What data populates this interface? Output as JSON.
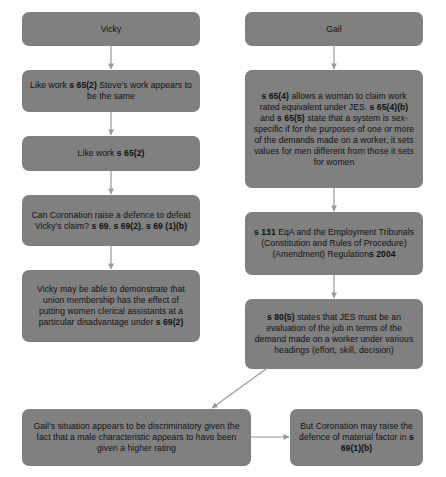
{
  "diagram": {
    "box_color": "#808080",
    "text_color": "#111111",
    "edge_color": "#9a9a9a",
    "background": "#ffffff",
    "columns": [
      {
        "name": "left-column",
        "heading": "Vicky"
      },
      {
        "name": "right-column",
        "heading": "Gail"
      }
    ],
    "nodes": [
      {
        "id": "vicky-header",
        "text": "Vicky"
      },
      {
        "id": "vicky-like-work-steve",
        "text": "Like work s 65(2)   Steve's work appears to be the same"
      },
      {
        "id": "vicky-like-work",
        "text": "Like work s 65(2)"
      },
      {
        "id": "vicky-defence",
        "text": "Can Coronation raise a defence to defeat Vicky's claim? s 69, s 69(2), s 69 (1)(b)"
      },
      {
        "id": "vicky-union-membership",
        "text": "Vicky may be able to demonstrate that union membership has the effect of putting women clerical assistants at a particular disadvantage under s 69(2)"
      },
      {
        "id": "gail-header",
        "text": "Gail"
      },
      {
        "id": "gail-s65",
        "text": "s 65(4) allows a woman to claim work rated equivalent under JES. s 65(4)(b) and s 65(5) state that a system is sex-specific if for the purposes of one or more of the demands made on a worker, it sets values for men different from those it sets for women"
      },
      {
        "id": "gail-s131",
        "text": "s 131 EqA and the Employment Tribunals (Constitution and Rules of Procedure)(Amendment) Regulations 2004"
      },
      {
        "id": "gail-s80",
        "text": "s 80(5) states that JES must be an evaluation of the job in terms of the demand made on a worker under various headings (effort, skill, decision)"
      },
      {
        "id": "gail-discriminatory",
        "text": "Gail's situation appears to be discriminatory given the fact that a male characteristic appears to have been given a higher rating"
      },
      {
        "id": "coronation-material-factor",
        "text": "But Coronation may raise the defence of material factor in s 69(1)(b)"
      }
    ],
    "edges": [
      {
        "from": "vicky-header",
        "to": "vicky-like-work-steve",
        "direction": "down"
      },
      {
        "from": "vicky-like-work-steve",
        "to": "vicky-like-work",
        "direction": "down"
      },
      {
        "from": "vicky-like-work",
        "to": "vicky-defence",
        "direction": "down"
      },
      {
        "from": "vicky-defence",
        "to": "vicky-union-membership",
        "direction": "down"
      },
      {
        "from": "gail-header",
        "to": "gail-s65",
        "direction": "down"
      },
      {
        "from": "gail-s65",
        "to": "gail-s131",
        "direction": "down"
      },
      {
        "from": "gail-s131",
        "to": "gail-s80",
        "direction": "down"
      },
      {
        "from": "gail-s80",
        "to": "gail-discriminatory",
        "direction": "diagonal-down-left"
      },
      {
        "from": "gail-discriminatory",
        "to": "coronation-material-factor",
        "direction": "right"
      }
    ]
  }
}
